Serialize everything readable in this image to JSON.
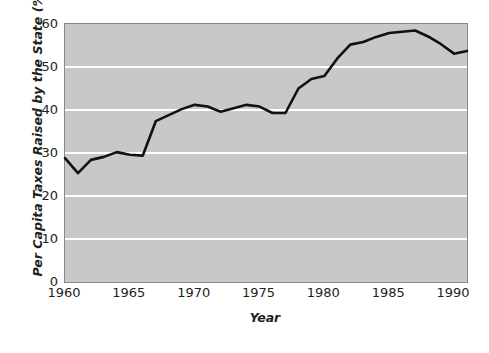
{
  "chart_data": {
    "type": "line",
    "title": "",
    "xlabel": "Year",
    "ylabel": "Per Capita Taxes Raised by the State (%)",
    "xlim": [
      1960,
      1991
    ],
    "ylim": [
      0,
      60
    ],
    "xticks": [
      1960,
      1965,
      1970,
      1975,
      1980,
      1985,
      1990
    ],
    "yticks": [
      0,
      10,
      20,
      30,
      40,
      50,
      60
    ],
    "grid": "horizontal",
    "legend": "none",
    "line_color": "#111111",
    "plot_background": "#c8c8c8",
    "gridline_color": "#ffffff",
    "x": [
      1960,
      1961,
      1962,
      1963,
      1964,
      1965,
      1966,
      1967,
      1968,
      1969,
      1970,
      1971,
      1972,
      1973,
      1974,
      1975,
      1976,
      1977,
      1978,
      1979,
      1980,
      1981,
      1982,
      1983,
      1984,
      1985,
      1986,
      1987,
      1988,
      1989,
      1990,
      1991
    ],
    "values": [
      28.8,
      25.3,
      28.4,
      29.1,
      30.2,
      29.6,
      29.4,
      37.4,
      38.8,
      40.2,
      41.2,
      40.8,
      39.6,
      40.4,
      41.2,
      40.8,
      39.3,
      39.3,
      45.0,
      47.2,
      47.9,
      52.0,
      55.2,
      55.8,
      57.0,
      57.9,
      58.2,
      58.5,
      57.1,
      55.3,
      53.1,
      53.7
    ],
    "series": [
      {
        "name": "Per Capita Taxes Raised by the State",
        "values": [
          28.8,
          25.3,
          28.4,
          29.1,
          30.2,
          29.6,
          29.4,
          37.4,
          38.8,
          40.2,
          41.2,
          40.8,
          39.6,
          40.4,
          41.2,
          40.8,
          39.3,
          39.3,
          45.0,
          47.2,
          47.9,
          52.0,
          55.2,
          55.8,
          57.0,
          57.9,
          58.2,
          58.5,
          57.1,
          55.3,
          53.1,
          53.7
        ]
      }
    ]
  }
}
